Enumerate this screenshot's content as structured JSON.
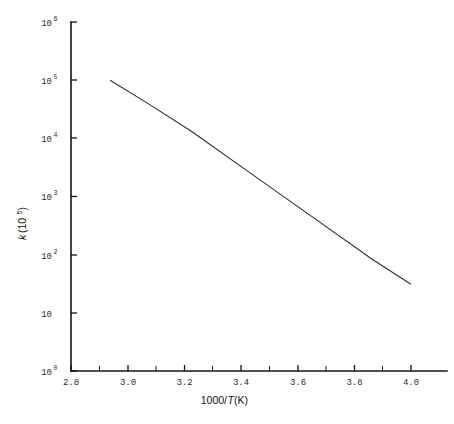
{
  "chart_data": {
    "type": "line",
    "title": "",
    "subtitle": "",
    "xlabel": "1000/T (K)",
    "ylabel": "k (10⁵)",
    "ylabel_base": "k",
    "ylabel_paren_open": " (10",
    "ylabel_exponent": "5",
    "ylabel_paren_close": ")",
    "xlabel_prefix": "1000/",
    "xlabel_italic": "T",
    "xlabel_suffix": " (K)",
    "xscale": "linear",
    "yscale": "log",
    "xlim": [
      2.8,
      4.05
    ],
    "ylim": [
      1,
      1000000
    ],
    "grid": false,
    "legend": false,
    "legend_position": "none",
    "x_ticks": [
      2.8,
      3.0,
      3.2,
      3.4,
      3.6,
      3.8,
      4.0
    ],
    "x_tick_labels": [
      "2.8",
      "3.0",
      "3.2",
      "3.4",
      "3.6",
      "3.8",
      "4.0"
    ],
    "x_minor_ticks": [
      2.9,
      3.1,
      3.3,
      3.5,
      3.7,
      3.9
    ],
    "y_ticks": [
      1,
      10,
      100,
      1000,
      10000,
      100000,
      1000000
    ],
    "y_tick_labels": [
      "10⁰",
      "10",
      "10²",
      "10³",
      "10⁴",
      "10⁵",
      "10⁶"
    ],
    "y_tick_mantissa": [
      "10",
      "10",
      "10",
      "10",
      "10",
      "10",
      "10"
    ],
    "y_tick_exponents": [
      "0",
      "",
      "2",
      "3",
      "4",
      "5",
      "6"
    ],
    "series": [
      {
        "name": "Arrhenius fit",
        "color": "#2e2e2e",
        "x": [
          2.93,
          3.05,
          3.2,
          3.4,
          3.6,
          3.8,
          3.93
        ],
        "y": [
          100000,
          41500,
          13200,
          2450,
          455,
          84.5,
          31.0
        ],
        "x_start": 2.93,
        "y_start": 100000,
        "x_end": 3.93,
        "y_end": 31.0
      }
    ],
    "annotations": []
  },
  "geometry": {
    "plot_left": 71,
    "plot_right": 447,
    "plot_top": 22,
    "plot_bottom": 371,
    "x_pixels": [
      71,
      128,
      184.5,
      241,
      298,
      354.5,
      411
    ],
    "x_minor_pixels": [
      99.5,
      156,
      212.5,
      269.5,
      326,
      382.5
    ],
    "y_pixels": [
      371,
      313,
      255,
      196.5,
      138,
      80,
      22
    ],
    "line_start_px": [
      99,
      79
    ],
    "line_end_px": [
      393,
      327
    ],
    "y_label_x": 26,
    "y_label_y": 240,
    "x_label_x": 227,
    "x_label_y": 404
  }
}
